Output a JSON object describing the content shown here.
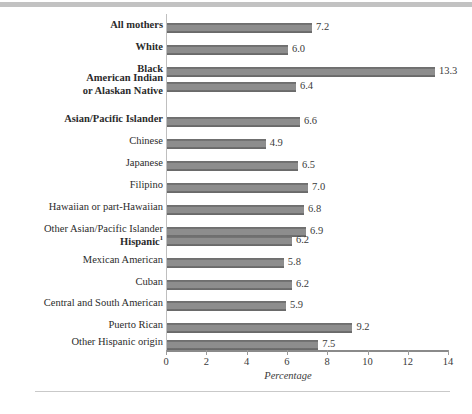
{
  "chart_data": {
    "type": "bar",
    "orientation": "horizontal",
    "title": "",
    "xlabel": "Percentage",
    "ylabel": "",
    "xlim": [
      0,
      14
    ],
    "xticks": [
      0,
      2,
      4,
      6,
      8,
      10,
      12,
      14
    ],
    "xtick_labels": [
      "0",
      "2",
      "4",
      "6",
      "8",
      "10",
      "12",
      "14"
    ],
    "grid": false,
    "legend": false,
    "categories": [
      "All mothers",
      "White",
      "Black",
      "American Indian or Alaskan Native",
      "Asian/Pacific Islander",
      "Chinese",
      "Japanese",
      "Filipino",
      "Hawaiian or part-Hawaiian",
      "Other Asian/Pacific Islander",
      "Hispanic",
      "Mexican American",
      "Cuban",
      "Central and South American",
      "Puerto Rican",
      "Other Hispanic origin"
    ],
    "values": [
      7.2,
      6.0,
      13.3,
      6.4,
      6.6,
      4.9,
      6.5,
      7.0,
      6.8,
      6.9,
      6.2,
      5.8,
      6.2,
      5.9,
      9.2,
      7.5
    ],
    "value_labels": [
      "7.2",
      "6.0",
      "13.3",
      "6.4",
      "6.6",
      "4.9",
      "6.5",
      "7.0",
      "6.8",
      "6.9",
      "6.2",
      "5.8",
      "6.2",
      "5.9",
      "9.2",
      "7.5"
    ]
  },
  "rows": [
    {
      "label": "All mothers",
      "label_line2": "",
      "value": 7.2,
      "value_label": "7.2",
      "bold": true,
      "footnote": ""
    },
    {
      "label": "White",
      "label_line2": "",
      "value": 6.0,
      "value_label": "6.0",
      "bold": true,
      "footnote": ""
    },
    {
      "label": "Black",
      "label_line2": "",
      "value": 13.3,
      "value_label": "13.3",
      "bold": true,
      "footnote": ""
    },
    {
      "label": "American Indian",
      "label_line2": "or Alaskan Native",
      "value": 6.4,
      "value_label": "6.4",
      "bold": true,
      "footnote": ""
    },
    {
      "label": "Asian/Pacific Islander",
      "label_line2": "",
      "value": 6.6,
      "value_label": "6.6",
      "bold": true,
      "footnote": ""
    },
    {
      "label": "Chinese",
      "label_line2": "",
      "value": 4.9,
      "value_label": "4.9",
      "bold": false,
      "footnote": ""
    },
    {
      "label": "Japanese",
      "label_line2": "",
      "value": 6.5,
      "value_label": "6.5",
      "bold": false,
      "footnote": ""
    },
    {
      "label": "Filipino",
      "label_line2": "",
      "value": 7.0,
      "value_label": "7.0",
      "bold": false,
      "footnote": ""
    },
    {
      "label": "Hawaiian or part-Hawaiian",
      "label_line2": "",
      "value": 6.8,
      "value_label": "6.8",
      "bold": false,
      "footnote": ""
    },
    {
      "label": "Other Asian/Pacific Islander",
      "label_line2": "",
      "value": 6.9,
      "value_label": "6.9",
      "bold": false,
      "footnote": ""
    },
    {
      "label": "Hispanic",
      "label_line2": "",
      "value": 6.2,
      "value_label": "6.2",
      "bold": true,
      "footnote": "1"
    },
    {
      "label": "Mexican American",
      "label_line2": "",
      "value": 5.8,
      "value_label": "5.8",
      "bold": false,
      "footnote": ""
    },
    {
      "label": "Cuban",
      "label_line2": "",
      "value": 6.2,
      "value_label": "6.2",
      "bold": false,
      "footnote": ""
    },
    {
      "label": "Central and South American",
      "label_line2": "",
      "value": 5.9,
      "value_label": "5.9",
      "bold": false,
      "footnote": ""
    },
    {
      "label": "Puerto Rican",
      "label_line2": "",
      "value": 9.2,
      "value_label": "9.2",
      "bold": false,
      "footnote": ""
    },
    {
      "label": "Other Hispanic origin",
      "label_line2": "",
      "value": 7.5,
      "value_label": "7.5",
      "bold": false,
      "footnote": ""
    }
  ],
  "axis": {
    "title": "Percentage",
    "ticks": [
      "0",
      "2",
      "4",
      "6",
      "8",
      "10",
      "12",
      "14"
    ]
  },
  "colors": {
    "bar_fill": "#8d8d8d",
    "bar_edge": "#6a6a6a",
    "axis_line": "#8a8a8a",
    "rule": "#c2c2c2",
    "text": "#2b2b2b"
  }
}
